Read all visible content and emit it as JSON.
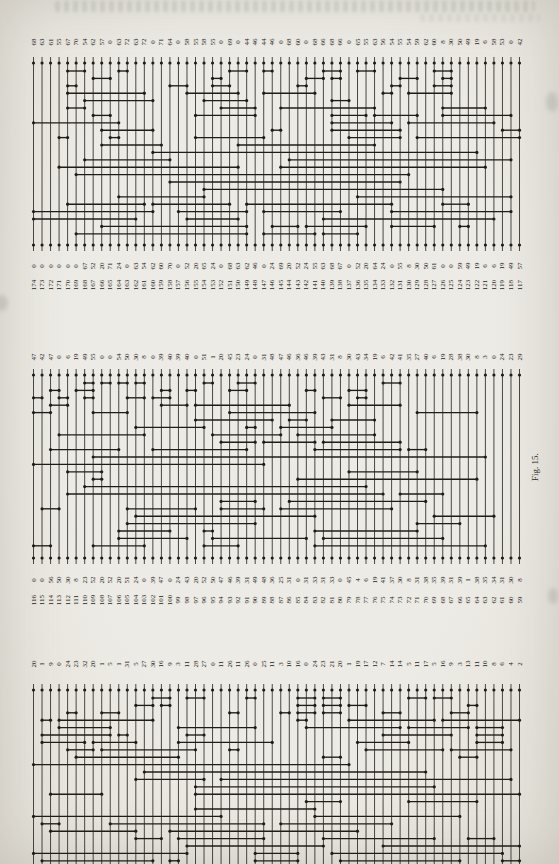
{
  "page": {
    "figure_caption": "Fig. 15.",
    "paper_color": "#edebe5",
    "ink_color": "#201d19"
  },
  "panels": [
    {
      "name": "top-network",
      "wire_count": 58,
      "top_labels": [
        68,
        63,
        61,
        55,
        67,
        70,
        54,
        62,
        57,
        0,
        63,
        72,
        63,
        72,
        0,
        71,
        64,
        0,
        58,
        55,
        58,
        55,
        0,
        69,
        0,
        44,
        46,
        44,
        46,
        0,
        68,
        60,
        0,
        68,
        66,
        68,
        66,
        0,
        65,
        55,
        63,
        56,
        54,
        55,
        54,
        59,
        62,
        60,
        8,
        30,
        50,
        49,
        19,
        6,
        58,
        53,
        0,
        42
      ],
      "bottom_values": [
        0,
        0,
        0,
        0,
        0,
        0,
        67,
        52,
        20,
        71,
        24,
        0,
        63,
        54,
        62,
        60,
        70,
        0,
        52,
        20,
        65,
        24,
        0,
        68,
        63,
        62,
        46,
        0,
        24,
        69,
        20,
        52,
        24,
        55,
        63,
        68,
        67,
        0,
        52,
        20,
        64,
        24,
        0,
        55,
        8,
        30,
        50,
        61,
        0,
        0,
        59,
        49,
        19,
        6,
        6,
        19,
        49,
        57
      ],
      "bottom_indices": {
        "start": 174,
        "end": 117
      },
      "seed": 11
    },
    {
      "name": "middle-network",
      "wire_count": 58,
      "top_labels": [
        47,
        42,
        47,
        0,
        6,
        19,
        49,
        55,
        0,
        0,
        54,
        50,
        30,
        8,
        0,
        39,
        40,
        39,
        40,
        0,
        51,
        1,
        20,
        45,
        23,
        24,
        0,
        31,
        48,
        47,
        46,
        36,
        46,
        39,
        43,
        31,
        8,
        30,
        43,
        34,
        19,
        6,
        42,
        41,
        35,
        27,
        40,
        6,
        19,
        28,
        38,
        30,
        8,
        3,
        0,
        24,
        23,
        29
      ],
      "bottom_values": [
        0,
        0,
        56,
        50,
        30,
        8,
        23,
        52,
        20,
        52,
        20,
        51,
        24,
        0,
        39,
        47,
        0,
        24,
        43,
        20,
        52,
        50,
        47,
        46,
        39,
        31,
        49,
        48,
        36,
        25,
        31,
        0,
        31,
        33,
        31,
        33,
        0,
        45,
        4,
        6,
        19,
        41,
        37,
        30,
        8,
        31,
        38,
        35,
        39,
        31,
        39,
        1,
        38,
        35,
        34,
        31,
        30,
        8
      ],
      "bottom_indices": {
        "start": 116,
        "end": 59
      },
      "seed": 22
    },
    {
      "name": "bottom-network",
      "wire_count": 58,
      "top_labels": [
        20,
        1,
        9,
        0,
        24,
        23,
        32,
        20,
        1,
        5,
        1,
        31,
        5,
        27,
        30,
        16,
        9,
        3,
        11,
        28,
        27,
        0,
        11,
        26,
        11,
        26,
        0,
        25,
        11,
        3,
        10,
        16,
        0,
        24,
        23,
        21,
        20,
        1,
        19,
        17,
        12,
        7,
        14,
        14,
        5,
        11,
        17,
        5,
        16,
        9,
        3,
        13,
        11,
        10,
        8,
        6,
        4,
        2
      ],
      "bottom_values": null,
      "bottom_indices": null,
      "seed": 33
    }
  ]
}
